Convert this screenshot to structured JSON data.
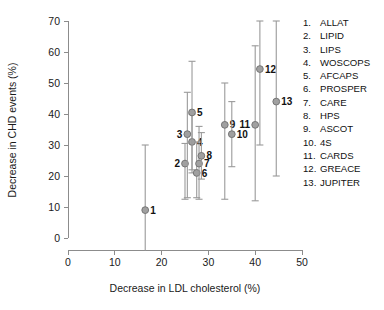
{
  "chart_data": {
    "type": "scatter",
    "title": "",
    "xlabel": "Decrease in LDL cholesterol (%)",
    "ylabel": "Decrease in CHD events (%)",
    "xlim": [
      0,
      50
    ],
    "ylim": [
      0,
      70
    ],
    "xticks": [
      0,
      10,
      20,
      30,
      40,
      50
    ],
    "yticks": [
      0,
      10,
      20,
      30,
      40,
      50,
      60,
      70
    ],
    "xtick_labels": [
      "0",
      "10",
      "20",
      "30",
      "40",
      "50"
    ],
    "ytick_labels": [
      "0",
      "10",
      "20",
      "30",
      "40",
      "50",
      "60",
      "70"
    ],
    "grid": false,
    "legend_position": "right",
    "error_bars": "vertical-95ci",
    "points": [
      {
        "id": 1,
        "name": "ALLAT",
        "x": 16.5,
        "y": 9.0,
        "ylow": -11.0,
        "yhigh": 30.0,
        "label": "1",
        "label_side": "right"
      },
      {
        "id": 2,
        "name": "LIPID",
        "x": 25.0,
        "y": 24.0,
        "ylow": 12.5,
        "yhigh": 30.5,
        "label": "2",
        "label_side": "left"
      },
      {
        "id": 3,
        "name": "LIPS",
        "x": 25.5,
        "y": 33.5,
        "ylow": 13.0,
        "yhigh": 47.0,
        "label": "3",
        "label_side": "left"
      },
      {
        "id": 4,
        "name": "WOSCOPS",
        "x": 26.5,
        "y": 31.0,
        "ylow": 21.0,
        "yhigh": 40.0,
        "label": "4",
        "label_side": "right"
      },
      {
        "id": 5,
        "name": "AFCAPS",
        "x": 26.5,
        "y": 40.5,
        "ylow": 22.0,
        "yhigh": 57.0,
        "label": "5",
        "label_side": "right"
      },
      {
        "id": 6,
        "name": "PROSPER",
        "x": 27.5,
        "y": 21.0,
        "ylow": 13.0,
        "yhigh": 31.0,
        "label": "6",
        "label_side": "right"
      },
      {
        "id": 7,
        "name": "CARE",
        "x": 28.0,
        "y": 24.0,
        "ylow": 12.5,
        "yhigh": 36.0,
        "label": "7",
        "label_side": "right"
      },
      {
        "id": 8,
        "name": "HPS",
        "x": 28.5,
        "y": 26.5,
        "ylow": 19.0,
        "yhigh": 34.0,
        "label": "8",
        "label_side": "right"
      },
      {
        "id": 9,
        "name": "ASCOT",
        "x": 33.5,
        "y": 36.5,
        "ylow": 12.5,
        "yhigh": 50.0,
        "label": "9",
        "label_side": "right"
      },
      {
        "id": 10,
        "name": "4S",
        "x": 35.0,
        "y": 33.5,
        "ylow": 23.0,
        "yhigh": 44.0,
        "label": "10",
        "label_side": "right"
      },
      {
        "id": 11,
        "name": "CARDS",
        "x": 40.0,
        "y": 36.5,
        "ylow": 12.0,
        "yhigh": 62.0,
        "label": "11",
        "label_side": "left"
      },
      {
        "id": 12,
        "name": "GREACE",
        "x": 41.0,
        "y": 54.5,
        "ylow": 30.0,
        "yhigh": 70.0,
        "label": "12",
        "label_side": "right"
      },
      {
        "id": 13,
        "name": "JUPITER",
        "x": 44.5,
        "y": 44.0,
        "ylow": 20.0,
        "yhigh": 70.0,
        "label": "13",
        "label_side": "right"
      }
    ],
    "colors": {
      "marker_fill": "#a0a0a0",
      "marker_edge": "#6e6e6e",
      "error_bar": "#9a9a9a",
      "axis": "#8c8c8c",
      "text": "#1a1a1a",
      "background": "#ffffff"
    }
  },
  "legend": {
    "entries": [
      {
        "num": "1.",
        "name": "ALLAT"
      },
      {
        "num": "2.",
        "name": "LIPID"
      },
      {
        "num": "3.",
        "name": "LIPS"
      },
      {
        "num": "4.",
        "name": "WOSCOPS"
      },
      {
        "num": "5.",
        "name": "AFCAPS"
      },
      {
        "num": "6.",
        "name": "PROSPER"
      },
      {
        "num": "7.",
        "name": "CARE"
      },
      {
        "num": "8.",
        "name": "HPS"
      },
      {
        "num": "9.",
        "name": "ASCOT"
      },
      {
        "num": "10.",
        "name": "4S"
      },
      {
        "num": "11.",
        "name": "CARDS"
      },
      {
        "num": "12.",
        "name": "GREACE"
      },
      {
        "num": "13.",
        "name": "JUPITER"
      }
    ]
  }
}
